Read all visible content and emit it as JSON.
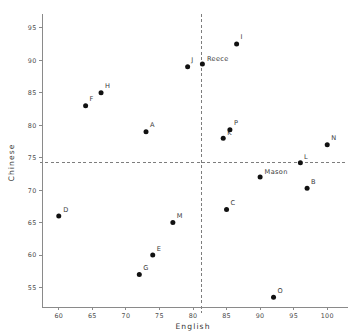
{
  "chart_data": {
    "type": "scatter",
    "title": "",
    "xlabel": "English",
    "ylabel": "Chinese",
    "xlim": [
      57.5,
      102.5
    ],
    "ylim": [
      52.0,
      96.5
    ],
    "xticks": [
      60,
      65,
      70,
      75,
      80,
      85,
      90,
      95,
      100
    ],
    "yticks": [
      55,
      60,
      65,
      70,
      75,
      80,
      85,
      90,
      95
    ],
    "grid": false,
    "legend": "none",
    "reference_lines": {
      "vertical_x": 81.3,
      "horizontal_y": 74.2,
      "style": "dashed"
    },
    "points": [
      {
        "label": "D",
        "x": 60.0,
        "y": 66.0
      },
      {
        "label": "F",
        "x": 64.0,
        "y": 83.0
      },
      {
        "label": "H",
        "x": 66.3,
        "y": 85.0
      },
      {
        "label": "G",
        "x": 72.0,
        "y": 57.0
      },
      {
        "label": "A",
        "x": 73.0,
        "y": 79.0
      },
      {
        "label": "E",
        "x": 74.0,
        "y": 60.0
      },
      {
        "label": "M",
        "x": 77.0,
        "y": 65.0
      },
      {
        "label": "J",
        "x": 79.2,
        "y": 89.0
      },
      {
        "label": "Reece",
        "x": 81.4,
        "y": 89.4
      },
      {
        "label": "K",
        "x": 84.5,
        "y": 78.0
      },
      {
        "label": "C",
        "x": 85.0,
        "y": 67.0
      },
      {
        "label": "P",
        "x": 85.5,
        "y": 79.3
      },
      {
        "label": "I",
        "x": 86.5,
        "y": 92.5
      },
      {
        "label": "Mason",
        "x": 90.0,
        "y": 72.0
      },
      {
        "label": "O",
        "x": 92.0,
        "y": 53.5
      },
      {
        "label": "L",
        "x": 96.0,
        "y": 74.2
      },
      {
        "label": "B",
        "x": 97.0,
        "y": 70.3
      },
      {
        "label": "N",
        "x": 100.0,
        "y": 77.0
      }
    ],
    "point_label_offsets": [
      {
        "label": "D",
        "dx": 4.5,
        "dy": -4.5
      },
      {
        "label": "F",
        "dx": 4.0,
        "dy": -4.5
      },
      {
        "label": "H",
        "dx": 4.0,
        "dy": -4.5
      },
      {
        "label": "G",
        "dx": 4.0,
        "dy": -4.5
      },
      {
        "label": "A",
        "dx": 4.0,
        "dy": -4.5
      },
      {
        "label": "E",
        "dx": 4.0,
        "dy": -4.5
      },
      {
        "label": "M",
        "dx": 4.0,
        "dy": -4.5
      },
      {
        "label": "J",
        "dx": 3.5,
        "dy": -4.5
      },
      {
        "label": "Reece",
        "dx": 4.5,
        "dy": -3.0
      },
      {
        "label": "K",
        "dx": 4.0,
        "dy": -3.5
      },
      {
        "label": "C",
        "dx": 4.0,
        "dy": -4.5
      },
      {
        "label": "P",
        "dx": 4.0,
        "dy": -4.5
      },
      {
        "label": "I",
        "dx": 4.0,
        "dy": -4.5
      },
      {
        "label": "Mason",
        "dx": 4.5,
        "dy": -3.5
      },
      {
        "label": "O",
        "dx": 4.0,
        "dy": -4.5
      },
      {
        "label": "L",
        "dx": 3.5,
        "dy": -4.0
      },
      {
        "label": "B",
        "dx": 4.0,
        "dy": -4.5
      },
      {
        "label": "N",
        "dx": 4.0,
        "dy": -4.5
      }
    ],
    "colors": {
      "point": "#111111",
      "axis": "#8a8a8a",
      "reference_line": "#7d7d7d",
      "tick_text": "#4a4a4a",
      "axis_title": "#333333",
      "background": "#ffffff"
    }
  }
}
